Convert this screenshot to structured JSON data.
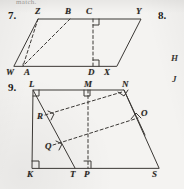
{
  "page": {
    "width": 184,
    "height": 189,
    "background_color": "#f3f2f0",
    "ink_color": "#2a2724"
  },
  "cut_off_header": {
    "text": "match."
  },
  "exercises": [
    {
      "number_label": "7.",
      "shape": "parallelogram",
      "vertices": [
        "W",
        "Z",
        "Y",
        "X"
      ],
      "marked_points": [
        "A",
        "B",
        "C",
        "D"
      ],
      "altitudes": [
        "Z to A",
        "B to A",
        "C to D"
      ],
      "right_angle_marks": [
        "C",
        "D"
      ]
    },
    {
      "number_label": "8.",
      "shape": "partially cropped figure",
      "vertex_labels": [
        "H",
        "J"
      ]
    },
    {
      "number_label": "9.",
      "shape": "trapezoid",
      "vertices": [
        "L",
        "N",
        "S",
        "K"
      ],
      "marked_points": [
        "M",
        "O",
        "Q",
        "R",
        "T",
        "P"
      ],
      "right_angle_marks": [
        "L",
        "M",
        "N",
        "O",
        "R",
        "Q",
        "K",
        "P"
      ]
    }
  ],
  "labels": {
    "fig7": {
      "number": "7.",
      "Z": "Z",
      "B": "B",
      "C": "C",
      "Y": "Y",
      "W": "W",
      "A": "A",
      "D": "D",
      "X": "X"
    },
    "fig8": {
      "number": "8.",
      "H": "H",
      "J": "J"
    },
    "fig9": {
      "number": "9.",
      "L": "L",
      "M": "M",
      "N": "N",
      "O": "O",
      "R": "R",
      "Q": "Q",
      "K": "K",
      "T": "T",
      "P": "P",
      "S": "S"
    }
  }
}
